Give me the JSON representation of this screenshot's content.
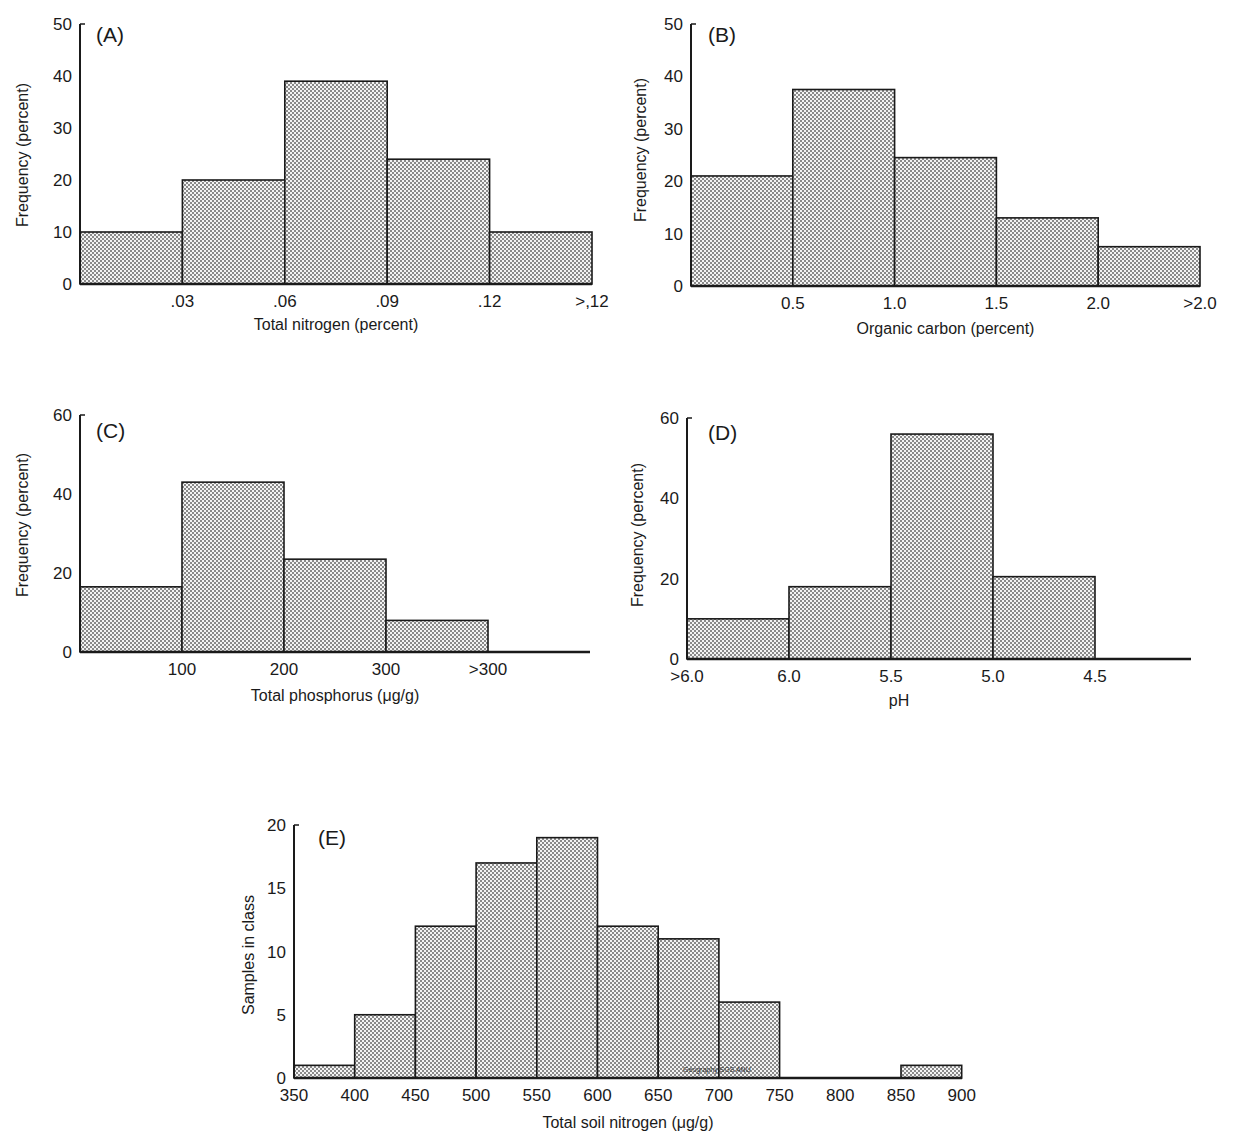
{
  "chart_data": [
    {
      "panel": "(A)",
      "type": "bar",
      "subtype": "histogram",
      "categories": [
        "<.03",
        ".03-.06",
        ".06-.09",
        ".09-.12",
        ">.12"
      ],
      "values": [
        10,
        20,
        39,
        24,
        10
      ],
      "xticks": [
        ".03",
        ".06",
        ".09",
        ".12",
        ">,12"
      ],
      "xlabel": "Total nitrogen (percent)",
      "ylabel": "Frequency (percent)",
      "yticks": [
        0,
        10,
        20,
        30,
        40,
        50
      ],
      "ylim": [
        0,
        50
      ],
      "grid": false,
      "legend": null
    },
    {
      "panel": "(B)",
      "type": "bar",
      "subtype": "histogram",
      "categories": [
        "<0.5",
        "0.5-1.0",
        "1.0-1.5",
        "1.5-2.0",
        ">2.0"
      ],
      "values": [
        21,
        37.5,
        24.5,
        13,
        7.5
      ],
      "xticks": [
        "0.5",
        "1.0",
        "1.5",
        "2.0",
        ">2.0"
      ],
      "xlabel": "Organic carbon (percent)",
      "ylabel": "Frequency (percent)",
      "yticks": [
        0,
        10,
        20,
        30,
        40,
        50
      ],
      "ylim": [
        0,
        50
      ],
      "grid": false,
      "legend": null
    },
    {
      "panel": "(C)",
      "type": "bar",
      "subtype": "histogram",
      "categories": [
        "<100",
        "100-200",
        "200-300",
        ">300"
      ],
      "values": [
        16.5,
        43,
        23.5,
        8
      ],
      "xticks": [
        "100",
        "200",
        "300",
        ">300"
      ],
      "xlabel": "Total phosphorus (μg/g)",
      "ylabel": "Frequency (percent)",
      "yticks": [
        0,
        20,
        40,
        60
      ],
      "ylim": [
        0,
        60
      ],
      "grid": false,
      "legend": null
    },
    {
      "panel": "(D)",
      "type": "bar",
      "subtype": "histogram",
      "categories": [
        ">6.0",
        "6.0-5.5",
        "5.5-5.0",
        "5.0-4.5"
      ],
      "values": [
        10,
        18,
        56,
        20.5
      ],
      "xticks": [
        ">6.0",
        "6.0",
        "5.5",
        "5.0",
        "4.5"
      ],
      "xlabel": "pH",
      "ylabel": "Frequency (percent)",
      "yticks": [
        0,
        20,
        40,
        60
      ],
      "ylim": [
        0,
        60
      ],
      "grid": false,
      "legend": null
    },
    {
      "panel": "(E)",
      "type": "bar",
      "subtype": "histogram",
      "categories": [
        "350-400",
        "400-450",
        "450-500",
        "500-550",
        "550-600",
        "600-650",
        "650-700",
        "700-750",
        "750-800",
        "800-850",
        "850-900"
      ],
      "values": [
        1,
        5,
        12,
        17,
        19,
        12,
        11,
        6,
        0,
        0,
        1
      ],
      "xticks": [
        "350",
        "400",
        "450",
        "500",
        "550",
        "600",
        "650",
        "700",
        "750",
        "800",
        "850",
        "900"
      ],
      "xlabel": "Total soil nitrogen (μg/g)",
      "ylabel": "Samples in class",
      "yticks": [
        0,
        5,
        10,
        15,
        20
      ],
      "ylim": [
        0,
        20
      ],
      "grid": false,
      "legend": null,
      "annotation": "Geography SGS ANU"
    }
  ],
  "colors": {
    "ink": "#1a1a1a",
    "fill_dot": "#8a8a8a",
    "background": "#ffffff"
  }
}
